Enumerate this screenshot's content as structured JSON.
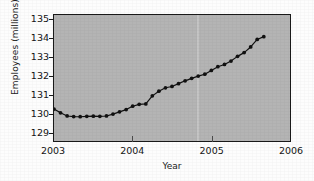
{
  "chart_data": {
    "type": "line",
    "title": "",
    "xlabel": "Year",
    "ylabel": "Employees (millions)",
    "xlim": [
      2003.0,
      2006.0
    ],
    "ylim": [
      128.55,
      135.25
    ],
    "xticks": [
      "2003",
      "2004",
      "2005",
      "2006"
    ],
    "xtick_values": [
      2003,
      2004,
      2005,
      2006
    ],
    "yticks": [
      "129",
      "130",
      "131",
      "132",
      "133",
      "134",
      "135"
    ],
    "ytick_values": [
      129,
      130,
      131,
      132,
      133,
      134,
      135
    ],
    "grid": false,
    "legend": null,
    "marker": "filled-circle",
    "marker_color": "#111111",
    "line_color": "#111111",
    "plot_background": "#b4b4b4",
    "series": [
      {
        "name": "Employees",
        "x": [
          2003.0,
          2003.083,
          2003.167,
          2003.25,
          2003.333,
          2003.417,
          2003.5,
          2003.583,
          2003.667,
          2003.75,
          2003.833,
          2003.917,
          2004.0,
          2004.083,
          2004.167,
          2004.25,
          2004.333,
          2004.417,
          2004.5,
          2004.583,
          2004.667,
          2004.75,
          2004.833,
          2004.917,
          2005.0,
          2005.083,
          2005.167,
          2005.25,
          2005.333,
          2005.417,
          2005.5,
          2005.583,
          2005.667
        ],
        "values": [
          130.25,
          130.05,
          129.88,
          129.85,
          129.84,
          129.86,
          129.87,
          129.86,
          129.88,
          129.98,
          130.1,
          130.22,
          130.4,
          130.5,
          130.52,
          130.95,
          131.2,
          131.38,
          131.45,
          131.6,
          131.75,
          131.88,
          132.0,
          132.1,
          132.3,
          132.5,
          132.62,
          132.8,
          133.05,
          133.25,
          133.55,
          133.95,
          134.1
        ]
      }
    ]
  },
  "axes": {
    "y_title": "Employees (millions)",
    "x_title": "Year"
  }
}
